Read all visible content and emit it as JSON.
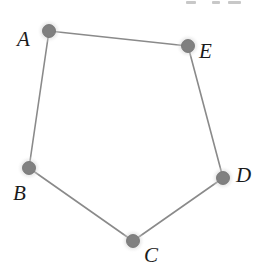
{
  "figure": {
    "kind": "undirected-graph-cycle",
    "background_color": "#ffffff",
    "width": 269,
    "height": 279,
    "node_core_color": "#808080",
    "node_core_edge_color": "#6e6e6e",
    "node_halo_color": "#c9c9c9",
    "edge_color": "#8a8a8a",
    "edge_width": 1.6,
    "label_color": "#1b1b1b"
  },
  "nodes": [
    {
      "id": "A",
      "label": "A",
      "cx": 49,
      "cy": 31,
      "label_x": 17,
      "label_y": 29,
      "core_r": 6.5,
      "halo_r": 12
    },
    {
      "id": "E",
      "label": "E",
      "cx": 188,
      "cy": 46,
      "label_x": 199,
      "label_y": 41,
      "core_r": 6.5,
      "halo_r": 12
    },
    {
      "id": "D",
      "label": "D",
      "cx": 223,
      "cy": 178,
      "label_x": 236,
      "label_y": 165,
      "core_r": 6.5,
      "halo_r": 12
    },
    {
      "id": "C",
      "label": "C",
      "cx": 133,
      "cy": 241,
      "label_x": 144,
      "label_y": 245,
      "core_r": 6.5,
      "halo_r": 12
    },
    {
      "id": "B",
      "label": "B",
      "cx": 29,
      "cy": 168,
      "label_x": 13,
      "label_y": 183,
      "core_r": 6.5,
      "halo_r": 12
    }
  ],
  "edges": [
    {
      "from": "A",
      "to": "E"
    },
    {
      "from": "E",
      "to": "D"
    },
    {
      "from": "D",
      "to": "C"
    },
    {
      "from": "C",
      "to": "B"
    },
    {
      "from": "B",
      "to": "A"
    }
  ],
  "top_text_fragments": [
    {
      "x": 186,
      "y": 1,
      "w": 10,
      "h": 3
    },
    {
      "x": 212,
      "y": 1,
      "w": 8,
      "h": 3
    },
    {
      "x": 228,
      "y": 1,
      "w": 13,
      "h": 3
    }
  ]
}
